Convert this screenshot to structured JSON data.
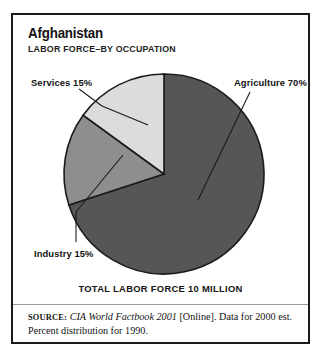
{
  "card": {
    "title": "Afghanistan",
    "subtitle": "LABOR FORCE–BY OCCUPATION",
    "total_caption": "TOTAL LABOR FORCE 10 MILLION"
  },
  "source": {
    "label": "Source:",
    "publication": "CIA World Factbook 2001",
    "rest": " [Online]. Data for 2000 est. Percent distribution for 1990."
  },
  "labels": {
    "agriculture": "Agriculture 70%",
    "services": "Services 15%",
    "industry": "Industry 15%"
  },
  "colors": {
    "agriculture": "#565656",
    "services": "#8e8e8e",
    "industry": "#dcdcdc",
    "outline": "#1b1b1b",
    "frame": "#1b1b1b",
    "text": "#131313"
  },
  "chart_data": {
    "type": "pie",
    "title": "Afghanistan",
    "subtitle": "LABOR FORCE–BY OCCUPATION",
    "caption": "TOTAL LABOR FORCE 10 MILLION",
    "total_label": "10 million",
    "unit": "percent",
    "start_angle_deg": 0,
    "direction": "clockwise",
    "legend": "labels-with-leader-lines",
    "grid": false,
    "categories": [
      "Agriculture",
      "Services",
      "Industry"
    ],
    "values": [
      70,
      15,
      15
    ],
    "slices": [
      {
        "label": "Agriculture",
        "value": 70,
        "text": "Agriculture 70%",
        "color": "#565656",
        "start_deg": 0,
        "end_deg": 252
      },
      {
        "label": "Services",
        "value": 15,
        "text": "Services 15%",
        "color": "#8e8e8e",
        "start_deg": 252,
        "end_deg": 306
      },
      {
        "label": "Industry",
        "value": 15,
        "text": "Industry 15%",
        "color": "#dcdcdc",
        "start_deg": 306,
        "end_deg": 360
      }
    ],
    "annotations": [
      "SOURCE: CIA World Factbook 2001 [Online]. Data for 2000 est.",
      "Percent distribution for 1990."
    ]
  }
}
